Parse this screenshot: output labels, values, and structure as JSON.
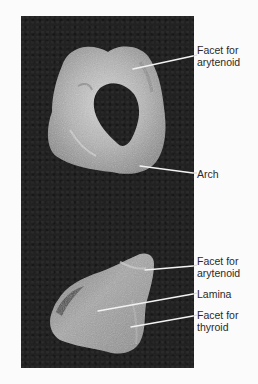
{
  "figure": {
    "panels": [
      {
        "id": "top",
        "subject": "cricoid cartilage, superior view",
        "labels": [
          {
            "line1": "Facet for",
            "line2": "arytenoid",
            "x": 197,
            "y": 44,
            "leader": {
              "x1": 133,
              "y1": 69,
              "x2": 193,
              "y2": 56
            }
          },
          {
            "line1": "Arch",
            "line2": "",
            "x": 197,
            "y": 168,
            "leader": {
              "x1": 140,
              "y1": 166,
              "x2": 193,
              "y2": 173
            }
          }
        ]
      },
      {
        "id": "bottom",
        "subject": "cricoid cartilage, lateral view",
        "labels": [
          {
            "line1": "Facet for",
            "line2": "arytenoid",
            "x": 197,
            "y": 255,
            "leader": {
              "x1": 145,
              "y1": 270,
              "x2": 193,
              "y2": 266
            }
          },
          {
            "line1": "Lamina",
            "line2": "",
            "x": 197,
            "y": 288,
            "leader": {
              "x1": 98,
              "y1": 311,
              "x2": 193,
              "y2": 294
            }
          },
          {
            "line1": "Facet for",
            "line2": "thyroid",
            "x": 197,
            "y": 309,
            "leader": {
              "x1": 131,
              "y1": 327,
              "x2": 193,
              "y2": 316
            }
          }
        ]
      }
    ],
    "colors": {
      "background": "#fbfbfb",
      "photo_background": "#222222",
      "cartilage_light": "#c9c9c9",
      "cartilage_mid": "#9a9a9a",
      "cartilage_dark": "#6b6b6b",
      "leader_line": "#f2f2f2",
      "label_text": "#2a2a2a"
    }
  }
}
